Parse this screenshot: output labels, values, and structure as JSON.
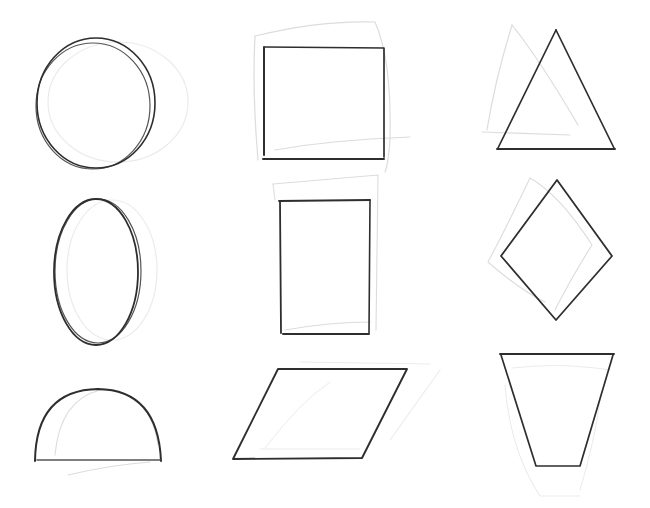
{
  "figure": {
    "ink_color": "#2e2e2e",
    "construction_line_color": "#dcdcdc",
    "background": "#ffffff"
  },
  "grid": {
    "rows": 3,
    "columns": 3,
    "shapes": [
      {
        "row": 1,
        "col": 1,
        "name": "circle"
      },
      {
        "row": 1,
        "col": 2,
        "name": "square"
      },
      {
        "row": 1,
        "col": 3,
        "name": "triangle"
      },
      {
        "row": 2,
        "col": 1,
        "name": "oval"
      },
      {
        "row": 2,
        "col": 2,
        "name": "rectangle"
      },
      {
        "row": 2,
        "col": 3,
        "name": "diamond"
      },
      {
        "row": 3,
        "col": 1,
        "name": "semicircle"
      },
      {
        "row": 3,
        "col": 2,
        "name": "parallelogram"
      },
      {
        "row": 3,
        "col": 3,
        "name": "trapezoid"
      }
    ]
  }
}
